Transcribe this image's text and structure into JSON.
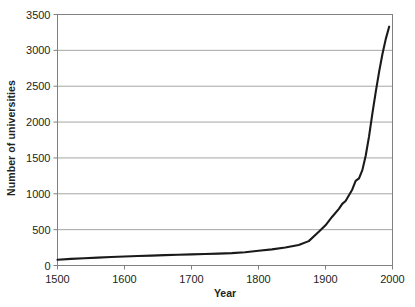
{
  "chart_data": {
    "type": "line",
    "title": "",
    "subtitle": "",
    "xlabel": "Year",
    "ylabel": "Number of universities",
    "xlim": [
      1500,
      2000
    ],
    "ylim": [
      0,
      3500
    ],
    "xticks": [
      1500,
      1600,
      1700,
      1800,
      1900,
      2000
    ],
    "yticks": [
      0,
      500,
      1000,
      1500,
      2000,
      2500,
      3000,
      3500
    ],
    "grid": "horizontal",
    "legend": "none",
    "annotations": [],
    "series": [
      {
        "name": "Number of universities",
        "color": "#1a1a1a",
        "x": [
          1500,
          1520,
          1540,
          1560,
          1580,
          1600,
          1620,
          1640,
          1660,
          1680,
          1700,
          1720,
          1740,
          1760,
          1780,
          1800,
          1820,
          1840,
          1860,
          1875,
          1890,
          1900,
          1910,
          1920,
          1925,
          1930,
          1940,
          1945,
          1950,
          1955,
          1960,
          1965,
          1970,
          1975,
          1980,
          1985,
          1990,
          1995
        ],
        "y": [
          80,
          92,
          102,
          110,
          118,
          125,
          132,
          138,
          144,
          150,
          155,
          160,
          165,
          172,
          185,
          205,
          225,
          250,
          285,
          340,
          470,
          560,
          680,
          790,
          860,
          900,
          1060,
          1180,
          1215,
          1330,
          1530,
          1800,
          2120,
          2420,
          2700,
          2950,
          3160,
          3330
        ]
      }
    ]
  },
  "axis": {
    "y_tick_labels": [
      "3500",
      "3000",
      "2500",
      "2000",
      "1500",
      "1000",
      "500",
      "0"
    ],
    "x_tick_labels": [
      "1500",
      "1600",
      "1700",
      "1800",
      "1900",
      "2000"
    ]
  },
  "colors": {
    "background": "#ffffff",
    "gridline": "#a6a6a6",
    "axis": "#808080",
    "line": "#1a1a1a",
    "text": "#231f20"
  }
}
